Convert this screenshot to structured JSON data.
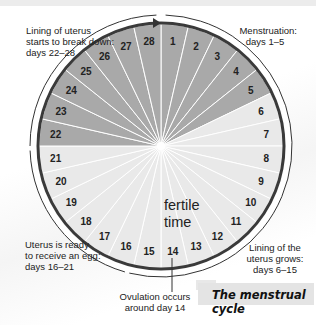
{
  "title": "The menstrual cycle",
  "center_label": [
    "fertile",
    "time"
  ],
  "days": [
    "1",
    "2",
    "3",
    "4",
    "5",
    "6",
    "7",
    "8",
    "9",
    "10",
    "11",
    "12",
    "13",
    "14",
    "15",
    "16",
    "17",
    "18",
    "19",
    "20",
    "21",
    "22",
    "23",
    "24",
    "25",
    "26",
    "27",
    "28"
  ],
  "dark_days": [
    22,
    23,
    24,
    25,
    26,
    27,
    28,
    1,
    2,
    3,
    4,
    5
  ],
  "colors": {
    "dark_sector": "#a9a9a9",
    "light_sector": "#e9e9e9",
    "rim": "#3a3a3a",
    "spoke": "#ffffff"
  },
  "annotations": {
    "breakdown": {
      "line1": "Lining of uterus",
      "line2": "starts to break down:",
      "line3": "days 22–28"
    },
    "menstruation": {
      "line1": "Menstruation:",
      "line2": "days 1–5"
    },
    "ready": {
      "line1": "Uterus is ready",
      "line2": "to receive an egg:",
      "line3": "days 16–21"
    },
    "grows": {
      "line1": "Lining of the",
      "line2": "uterus grows:",
      "line3": "days 6–15"
    },
    "ovulation": {
      "line1": "Ovulation occurs",
      "line2": "around day 14"
    }
  }
}
